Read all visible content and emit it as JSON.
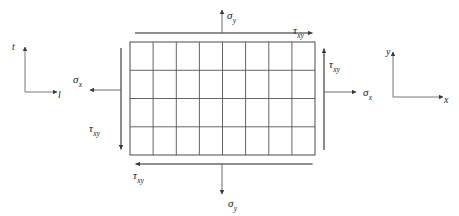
{
  "figure": {
    "type": "stress-element-diagram",
    "background_color": "#ffffff",
    "line_color": "#4d4d4d",
    "text_color": "#1a1a1a"
  },
  "element": {
    "name": "stress-element-grid",
    "columns": 8,
    "rows": 4,
    "left": 130,
    "top": 42,
    "width": 185,
    "height": 113
  },
  "axes": {
    "left_system": {
      "name": "material-axes",
      "vertical_label": "t",
      "horizontal_label": "l",
      "origin_x": 25,
      "origin_y": 92
    },
    "right_system": {
      "name": "global-axes",
      "vertical_label": "y",
      "horizontal_label": "x",
      "origin_x": 393,
      "origin_y": 97
    }
  },
  "stresses": {
    "sigma_top": {
      "symbol": "σ",
      "subscript": "y",
      "direction": "up",
      "edge": "top"
    },
    "sigma_bottom": {
      "symbol": "σ",
      "subscript": "y",
      "direction": "down",
      "edge": "bottom"
    },
    "sigma_left": {
      "symbol": "σ",
      "subscript": "x",
      "direction": "left",
      "edge": "left"
    },
    "sigma_right": {
      "symbol": "σ",
      "subscript": "x",
      "direction": "right",
      "edge": "right"
    },
    "tau_top": {
      "symbol": "τ",
      "subscript": "xy",
      "direction": "right",
      "edge": "top"
    },
    "tau_bottom": {
      "symbol": "τ",
      "subscript": "xy",
      "direction": "left",
      "edge": "bottom"
    },
    "tau_left": {
      "symbol": "τ",
      "subscript": "xy",
      "direction": "down",
      "edge": "left"
    },
    "tau_right": {
      "symbol": "τ",
      "subscript": "xy",
      "direction": "up",
      "edge": "right"
    }
  }
}
